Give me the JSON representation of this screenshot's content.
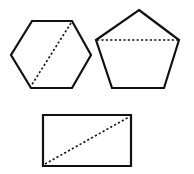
{
  "diagram": {
    "background": "#ffffff",
    "stroke_color": "#111111",
    "shapes": [
      {
        "name": "hexagon",
        "points": "32,21 72,21 91,55 72,88 31,88 11,55",
        "dashed": {
          "x1": 71,
          "y1": 23,
          "x2": 31,
          "y2": 86,
          "kind": "diagonal"
        }
      },
      {
        "name": "pentagon",
        "points": "139,10 179,40 164,88 112,88 96,40",
        "dashed": {
          "x1": 97,
          "y1": 40,
          "x2": 178,
          "y2": 40,
          "kind": "diagonal"
        }
      },
      {
        "name": "rectangle",
        "points": "43,115 131,115 131,166 43,166",
        "dashed": {
          "x1": 45,
          "y1": 164,
          "x2": 129,
          "y2": 117,
          "kind": "diagonal"
        }
      }
    ]
  }
}
